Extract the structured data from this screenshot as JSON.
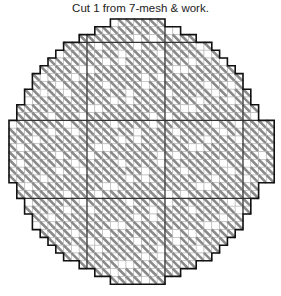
{
  "caption": "Cut 1 from 7-mesh & work.",
  "chart_data": {
    "type": "needlepoint-pattern",
    "title": "Cut 1 from 7-mesh & work.",
    "shape": "circle",
    "grid": {
      "cols": 34,
      "rows": 34,
      "origin_x": 9,
      "origin_y": 19,
      "cell": 7.8
    },
    "row_spans": [
      [
        13,
        20
      ],
      [
        11,
        22
      ],
      [
        9,
        24
      ],
      [
        7,
        26
      ],
      [
        6,
        27
      ],
      [
        5,
        28
      ],
      [
        4,
        29
      ],
      [
        3,
        30
      ],
      [
        3,
        30
      ],
      [
        2,
        31
      ],
      [
        2,
        31
      ],
      [
        1,
        32
      ],
      [
        1,
        32
      ],
      [
        0,
        34
      ],
      [
        0,
        34
      ],
      [
        0,
        34
      ],
      [
        0,
        34
      ],
      [
        0,
        34
      ],
      [
        0,
        34
      ],
      [
        0,
        34
      ],
      [
        0,
        34
      ],
      [
        1,
        32
      ],
      [
        1,
        32
      ],
      [
        2,
        31
      ],
      [
        2,
        31
      ],
      [
        3,
        30
      ],
      [
        3,
        30
      ],
      [
        4,
        29
      ],
      [
        5,
        28
      ],
      [
        6,
        27
      ],
      [
        7,
        26
      ],
      [
        9,
        24
      ],
      [
        11,
        22
      ],
      [
        13,
        20
      ]
    ],
    "section_lines": {
      "x": [
        10,
        20,
        30
      ],
      "y": [
        3,
        13,
        23
      ]
    },
    "colors": {
      "stitch": "#8a8a8a",
      "grid": "#b5b5b5",
      "outline": "#111111",
      "divider": "#333333",
      "background": "#ffffff"
    }
  }
}
